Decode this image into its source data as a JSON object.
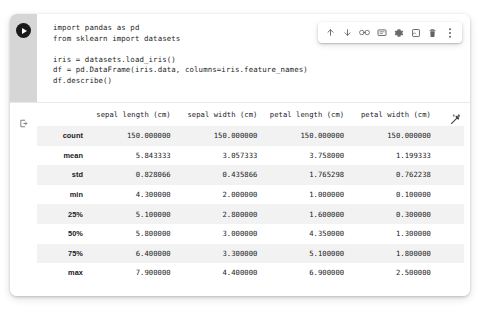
{
  "toolbar": {
    "buttons": [
      {
        "name": "move-cell-up-icon",
        "label": "Move cell up"
      },
      {
        "name": "move-cell-down-icon",
        "label": "Move cell down"
      },
      {
        "name": "link-to-cell-icon",
        "label": "Link to cell"
      },
      {
        "name": "comment-icon",
        "label": "Add comment"
      },
      {
        "name": "gear-icon",
        "label": "Cell settings"
      },
      {
        "name": "copy-cell-icon",
        "label": "Copy cell"
      },
      {
        "name": "trash-icon",
        "label": "Delete cell"
      },
      {
        "name": "more-options-icon",
        "label": "More cell actions"
      }
    ]
  },
  "cell": {
    "run_button_label": "Run cell",
    "output_icon_label": "Cell output",
    "code_lines": [
      "import pandas as pd",
      "from sklearn import datasets",
      "",
      "iris = datasets.load_iris()",
      "df = pd.DataFrame(iris.data, columns=iris.feature_names)",
      "df.describe()"
    ]
  },
  "output": {
    "wand_label": "Suggest charts",
    "table": {
      "index_header": "",
      "columns": [
        "sepal length (cm)",
        "sepal width (cm)",
        "petal length (cm)",
        "petal width (cm)"
      ],
      "rows": [
        {
          "index": "count",
          "values": [
            "150.000000",
            "150.000000",
            "150.000000",
            "150.000000"
          ]
        },
        {
          "index": "mean",
          "values": [
            "5.843333",
            "3.057333",
            "3.758000",
            "1.199333"
          ]
        },
        {
          "index": "std",
          "values": [
            "0.828066",
            "0.435866",
            "1.765298",
            "0.762238"
          ]
        },
        {
          "index": "min",
          "values": [
            "4.300000",
            "2.000000",
            "1.000000",
            "0.100000"
          ]
        },
        {
          "index": "25%",
          "values": [
            "5.100000",
            "2.800000",
            "1.600000",
            "0.300000"
          ]
        },
        {
          "index": "50%",
          "values": [
            "5.800000",
            "3.000000",
            "4.350000",
            "1.300000"
          ]
        },
        {
          "index": "75%",
          "values": [
            "6.400000",
            "3.300000",
            "5.100000",
            "1.800000"
          ]
        },
        {
          "index": "max",
          "values": [
            "7.900000",
            "4.400000",
            "6.900000",
            "2.500000"
          ]
        }
      ]
    }
  },
  "colors": {
    "gutter": "#d6d6d6",
    "run_button": "#1a1a1a",
    "row_alt": "#f2f2f2",
    "text": "#202124",
    "icon": "#5f6368"
  }
}
